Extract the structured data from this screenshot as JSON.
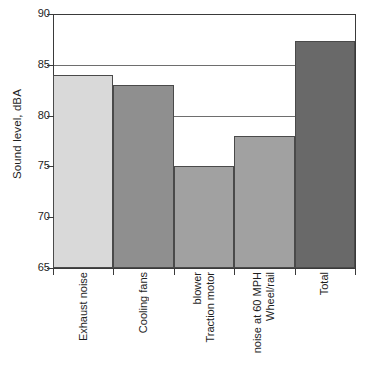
{
  "chart_data": {
    "type": "bar",
    "title": "",
    "xlabel": "",
    "ylabel": "Sound level, dBA",
    "ylim": [
      65,
      90
    ],
    "ytick_labels": [
      "90",
      "85",
      "80",
      "75",
      "70",
      "65"
    ],
    "ytick_values": [
      90,
      85,
      80,
      75,
      70,
      65
    ],
    "grid": "horizontal",
    "gridline_values": [
      85,
      80
    ],
    "legend": "none",
    "categories": [
      "Exhaust noise",
      "Cooling fans",
      "Traction motor blower",
      "Wheel/rail noise at 60 MPH",
      "Total"
    ],
    "category_lines": [
      [
        "Exhaust noise"
      ],
      [
        "Cooling fans"
      ],
      [
        "Traction motor",
        "blower"
      ],
      [
        "Wheel/rail",
        "noise at 60 MPH"
      ],
      [
        "Total"
      ]
    ],
    "values": [
      84,
      83,
      75,
      78,
      87.3
    ],
    "bar_colors": [
      "#d9d9d9",
      "#8f8f8f",
      "#a1a1a1",
      "#a1a1a1",
      "#696969"
    ],
    "bar_edge_color": "#4a4a4a",
    "axis_color": "#3a3a3a",
    "gridline_color": "#6e6e6e",
    "text_color": "#1e1e1e",
    "background": "#ffffff"
  }
}
